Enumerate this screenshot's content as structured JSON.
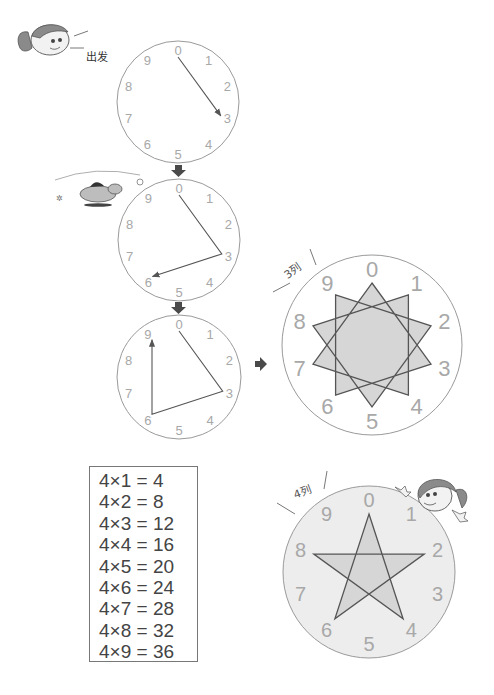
{
  "colors": {
    "circle_stroke": "#9a9a9a",
    "digit": "#a8a8a8",
    "line": "#555555",
    "star_fill": "#d6d6d6",
    "bottom_circle_fill": "#ededed",
    "arrow": "#4a4a4a"
  },
  "start_label": "出发",
  "clock_digits": [
    "0",
    "1",
    "2",
    "3",
    "4",
    "5",
    "6",
    "7",
    "8",
    "9"
  ],
  "clocks": [
    {
      "name": "clock-step-1",
      "path": [
        0,
        3
      ],
      "arrow_end": true
    },
    {
      "name": "clock-step-2",
      "path": [
        0,
        3,
        6
      ],
      "arrow_end": true
    },
    {
      "name": "clock-step-3",
      "path": [
        0,
        3,
        6,
        9
      ],
      "arrow_end": true
    }
  ],
  "star_3": {
    "label": "3列",
    "step": 3,
    "points": 10
  },
  "star_4": {
    "label": "4列",
    "step": 4,
    "points": 5
  },
  "multiplication_table": [
    "4×1 = 4",
    "4×2 = 8",
    "4×3 = 12",
    "4×4 = 16",
    "4×5 = 20",
    "4×6 = 24",
    "4×7 = 28",
    "4×8 = 32",
    "4×9 = 36"
  ],
  "icons": [
    "girl-face-icon",
    "dog-running-icon",
    "down-arrow-icon",
    "right-arrow-icon",
    "girl-waving-icon"
  ]
}
